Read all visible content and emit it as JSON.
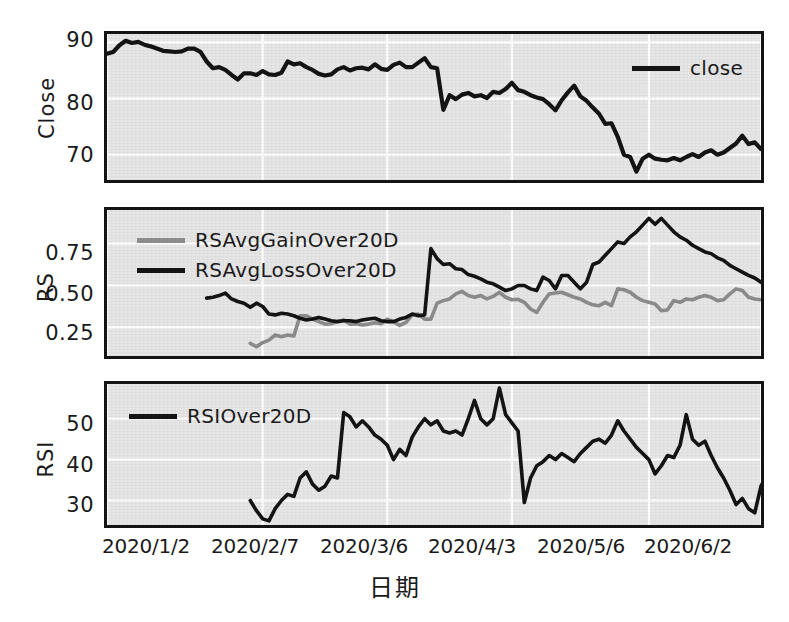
{
  "figure": {
    "width": 789,
    "height": 622,
    "background": "#ffffff",
    "panel_background": "#e6e6e6",
    "grid_color": "#ffffff",
    "frame_color": "#141414"
  },
  "axis": {
    "x_title": "日期",
    "x_ticks": [
      "2020/1/2",
      "2020/2/7",
      "2020/3/6",
      "2020/4/3",
      "2020/5/6",
      "2020/6/2"
    ]
  },
  "panels": [
    {
      "name": "close-panel",
      "ylabel": "Close",
      "yticks": [
        "70",
        "80",
        "90"
      ],
      "legend": [
        {
          "label": "close",
          "color": "#141414"
        }
      ]
    },
    {
      "name": "rs-panel",
      "ylabel": "RS",
      "yticks": [
        "0.25",
        "0.50",
        "0.75"
      ],
      "legend": [
        {
          "label": "RSAvgGainOver20D",
          "color": "#8c8c8c"
        },
        {
          "label": "RSAvgLossOver20D",
          "color": "#141414"
        }
      ]
    },
    {
      "name": "rsi-panel",
      "ylabel": "RSI",
      "yticks": [
        "30",
        "40",
        "50"
      ],
      "legend": [
        {
          "label": "RSIOver20D",
          "color": "#141414"
        }
      ]
    }
  ],
  "chart_data": [
    {
      "type": "line",
      "panel": "close-panel",
      "title": "",
      "xlabel": "日期",
      "ylabel": "Close",
      "ylim": [
        65.5,
        91.5
      ],
      "yticks": [
        70,
        80,
        90
      ],
      "grid": true,
      "legend_position": "top-right",
      "x_tick_labels": [
        "2020/1/2",
        "2020/2/7",
        "2020/3/6",
        "2020/4/3",
        "2020/5/6",
        "2020/6/2"
      ],
      "x_tick_indices": [
        0,
        25,
        45,
        65,
        87,
        105
      ],
      "series": [
        {
          "name": "close",
          "color": "#141414",
          "values": [
            88.0,
            88.3,
            89.5,
            90.3,
            89.9,
            90.1,
            89.6,
            89.3,
            88.9,
            88.5,
            88.4,
            88.3,
            88.4,
            88.9,
            88.9,
            88.3,
            86.6,
            85.4,
            85.6,
            85.1,
            84.2,
            83.4,
            84.5,
            84.5,
            84.2,
            84.9,
            84.3,
            84.2,
            84.6,
            86.6,
            86.1,
            86.3,
            85.6,
            85.1,
            84.4,
            84.1,
            84.3,
            85.2,
            85.6,
            85.0,
            85.4,
            85.5,
            85.2,
            86.1,
            85.3,
            85.1,
            86.0,
            86.4,
            85.6,
            85.6,
            86.4,
            87.2,
            85.6,
            85.4,
            78.0,
            80.6,
            79.9,
            80.7,
            81.0,
            80.4,
            80.6,
            80.1,
            81.2,
            81.0,
            81.7,
            82.8,
            81.5,
            81.2,
            80.6,
            80.2,
            79.9,
            79.0,
            77.9,
            79.7,
            81.1,
            82.3,
            80.4,
            79.6,
            78.4,
            77.3,
            75.5,
            75.6,
            73.2,
            70.0,
            69.6,
            67.0,
            69.3,
            70.0,
            69.3,
            69.1,
            69.0,
            69.4,
            69.0,
            69.6,
            70.1,
            69.6,
            70.4,
            70.8,
            70.0,
            70.4,
            71.2,
            72.0,
            73.4,
            71.9,
            72.2,
            71.0
          ]
        }
      ]
    },
    {
      "type": "line",
      "panel": "rs-panel",
      "title": "",
      "xlabel": "日期",
      "ylabel": "RS",
      "ylim": [
        0.08,
        0.95
      ],
      "yticks": [
        0.25,
        0.5,
        0.75
      ],
      "grid": true,
      "legend_position": "top-left",
      "x_tick_labels": [
        "2020/1/2",
        "2020/2/7",
        "2020/3/6",
        "2020/4/3",
        "2020/5/6",
        "2020/6/2"
      ],
      "x_tick_indices": [
        0,
        25,
        45,
        65,
        87,
        105
      ],
      "series": [
        {
          "name": "RSAvgGainOver20D",
          "color": "#8c8c8c",
          "start_index": 23,
          "values": [
            0.155,
            0.135,
            0.16,
            0.175,
            0.205,
            0.195,
            0.205,
            0.2,
            0.32,
            0.32,
            0.3,
            0.285,
            0.27,
            0.272,
            0.285,
            0.295,
            0.27,
            0.272,
            0.265,
            0.27,
            0.278,
            0.272,
            0.3,
            0.285,
            0.262,
            0.28,
            0.325,
            0.33,
            0.3,
            0.3,
            0.395,
            0.41,
            0.42,
            0.45,
            0.465,
            0.44,
            0.43,
            0.44,
            0.42,
            0.435,
            0.46,
            0.43,
            0.415,
            0.418,
            0.4,
            0.36,
            0.34,
            0.4,
            0.45,
            0.455,
            0.46,
            0.445,
            0.43,
            0.42,
            0.4,
            0.385,
            0.38,
            0.4,
            0.38,
            0.48,
            0.475,
            0.46,
            0.43,
            0.41,
            0.4,
            0.39,
            0.35,
            0.355,
            0.41,
            0.4,
            0.42,
            0.415,
            0.43,
            0.44,
            0.43,
            0.41,
            0.415,
            0.45,
            0.48,
            0.47,
            0.43,
            0.42,
            0.415
          ]
        },
        {
          "name": "RSAvgLossOver20D",
          "color": "#141414",
          "start_index": 16,
          "values": [
            0.425,
            0.43,
            0.44,
            0.455,
            0.42,
            0.405,
            0.395,
            0.37,
            0.395,
            0.375,
            0.33,
            0.325,
            0.335,
            0.33,
            0.32,
            0.305,
            0.295,
            0.3,
            0.31,
            0.3,
            0.29,
            0.285,
            0.29,
            0.29,
            0.285,
            0.295,
            0.3,
            0.305,
            0.29,
            0.285,
            0.285,
            0.3,
            0.31,
            0.33,
            0.32,
            0.325,
            0.72,
            0.66,
            0.625,
            0.63,
            0.6,
            0.595,
            0.565,
            0.555,
            0.54,
            0.52,
            0.51,
            0.49,
            0.47,
            0.48,
            0.5,
            0.5,
            0.48,
            0.47,
            0.55,
            0.53,
            0.48,
            0.56,
            0.56,
            0.52,
            0.48,
            0.52,
            0.625,
            0.64,
            0.68,
            0.72,
            0.76,
            0.75,
            0.79,
            0.82,
            0.86,
            0.9,
            0.865,
            0.9,
            0.86,
            0.82,
            0.79,
            0.77,
            0.74,
            0.72,
            0.7,
            0.69,
            0.665,
            0.65,
            0.62,
            0.6,
            0.58,
            0.56,
            0.545,
            0.52,
            0.5,
            0.52,
            0.505,
            0.54
          ]
        }
      ]
    },
    {
      "type": "line",
      "panel": "rsi-panel",
      "title": "",
      "xlabel": "日期",
      "ylabel": "RSI",
      "ylim": [
        24.0,
        58.5
      ],
      "yticks": [
        30,
        40,
        50
      ],
      "grid": true,
      "legend_position": "top-left",
      "x_tick_labels": [
        "2020/1/2",
        "2020/2/7",
        "2020/3/6",
        "2020/4/3",
        "2020/5/6",
        "2020/6/2"
      ],
      "x_tick_indices": [
        0,
        25,
        45,
        65,
        87,
        105
      ],
      "series": [
        {
          "name": "RSIOver20D",
          "color": "#141414",
          "start_index": 23,
          "values": [
            30.0,
            27.5,
            25.5,
            25.0,
            28.0,
            30.0,
            31.5,
            31.0,
            35.5,
            37.0,
            34.0,
            32.5,
            33.5,
            36.0,
            35.5,
            51.5,
            50.5,
            48.0,
            49.5,
            48.0,
            46.0,
            45.0,
            43.5,
            40.0,
            42.5,
            41.0,
            45.5,
            48.0,
            50.0,
            48.5,
            49.5,
            47.0,
            46.5,
            47.0,
            46.0,
            50.0,
            54.5,
            50.0,
            48.5,
            50.0,
            57.5,
            51.0,
            49.0,
            47.0,
            29.5,
            35.5,
            38.5,
            39.5,
            41.0,
            40.0,
            41.5,
            40.5,
            39.5,
            41.5,
            43.0,
            44.5,
            45.0,
            44.0,
            46.0,
            49.5,
            47.0,
            45.0,
            43.0,
            41.5,
            40.0,
            36.5,
            38.5,
            41.0,
            40.5,
            43.5,
            51.0,
            45.0,
            43.5,
            44.5,
            41.0,
            38.0,
            35.5,
            32.5,
            29.0,
            30.5,
            28.0,
            27.0,
            33.5,
            36.5,
            36.0,
            35.0,
            35.5,
            35.0,
            36.0,
            36.5,
            38.0,
            40.5,
            39.5,
            42.5,
            41.5,
            44.0,
            47.5,
            50.5,
            48.5,
            47.5,
            48.0,
            45.0,
            43.0
          ]
        }
      ]
    }
  ]
}
